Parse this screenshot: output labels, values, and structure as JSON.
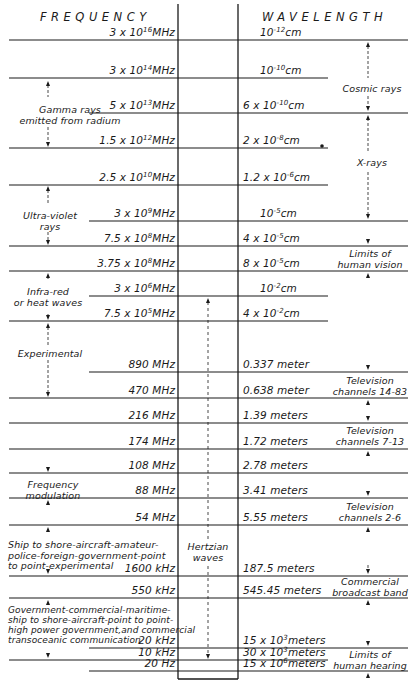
{
  "headers": {
    "frequency": "FREQUENCY",
    "wavelength": "WAVELENGTH"
  },
  "rows": [
    {
      "y": 40,
      "freq": "3 x 10",
      "freq_exp": "16",
      "freq_unit": "MHz",
      "wave": "10",
      "wave_exp": "-12",
      "wave_unit": "cm"
    },
    {
      "y": 78,
      "freq": "3 x 10",
      "freq_exp": "14",
      "freq_unit": "MHz",
      "wave": "10",
      "wave_exp": "-10",
      "wave_unit": "cm"
    },
    {
      "y": 113,
      "freq": "5 x 10",
      "freq_exp": "13",
      "freq_unit": "MHz",
      "wave": "6 x 10",
      "wave_exp": "-10",
      "wave_unit": "cm"
    },
    {
      "y": 148,
      "freq": "1.5 x 10",
      "freq_exp": "12",
      "freq_unit": "MHz",
      "wave": "2 x 10",
      "wave_exp": "-8",
      "wave_unit": "cm"
    },
    {
      "y": 185,
      "freq": "2.5 x 10",
      "freq_exp": "10",
      "freq_unit": "MHz",
      "wave": "1.2 x 10",
      "wave_exp": "-6",
      "wave_unit": "cm"
    },
    {
      "y": 221,
      "freq": "3 x 10",
      "freq_exp": "9",
      "freq_unit": "MHz",
      "wave": "10",
      "wave_exp": "-5",
      "wave_unit": "cm"
    },
    {
      "y": 246,
      "freq": "7.5 x 10",
      "freq_exp": "8",
      "freq_unit": "MHz",
      "wave": "4 x 10",
      "wave_exp": "-5",
      "wave_unit": "cm"
    },
    {
      "y": 271,
      "freq": "3.75 x 10",
      "freq_exp": "8",
      "freq_unit": "MHz",
      "wave": "8 x 10",
      "wave_exp": "-5",
      "wave_unit": "cm"
    },
    {
      "y": 296,
      "freq": "3 x 10",
      "freq_exp": "6",
      "freq_unit": "MHz",
      "wave": "10",
      "wave_exp": "-2",
      "wave_unit": "cm"
    },
    {
      "y": 321,
      "freq": "7.5 x 10",
      "freq_exp": "5",
      "freq_unit": "MHz",
      "wave": "4 x 10",
      "wave_exp": "-2",
      "wave_unit": "cm"
    },
    {
      "y": 372,
      "freq": "890 MHz",
      "freq_exp": "",
      "freq_unit": "",
      "wave": "0.337 meter",
      "wave_exp": "",
      "wave_unit": ""
    },
    {
      "y": 398,
      "freq": "470 MHz",
      "freq_exp": "",
      "freq_unit": "",
      "wave": "0.638 meter",
      "wave_exp": "",
      "wave_unit": ""
    },
    {
      "y": 423,
      "freq": "216 MHz",
      "freq_exp": "",
      "freq_unit": "",
      "wave": "1.39 meters",
      "wave_exp": "",
      "wave_unit": ""
    },
    {
      "y": 449,
      "freq": "174 MHz",
      "freq_exp": "",
      "freq_unit": "",
      "wave": "1.72 meters",
      "wave_exp": "",
      "wave_unit": ""
    },
    {
      "y": 473,
      "freq": "108 MHz",
      "freq_exp": "",
      "freq_unit": "",
      "wave": "2.78 meters",
      "wave_exp": "",
      "wave_unit": ""
    },
    {
      "y": 498,
      "freq": "88 MHz",
      "freq_exp": "",
      "freq_unit": "",
      "wave": "3.41 meters",
      "wave_exp": "",
      "wave_unit": ""
    },
    {
      "y": 525,
      "freq": "54 MHz",
      "freq_exp": "",
      "freq_unit": "",
      "wave": "5.55 meters",
      "wave_exp": "",
      "wave_unit": ""
    },
    {
      "y": 576,
      "freq": "1600 kHz",
      "freq_exp": "",
      "freq_unit": "",
      "wave": "187.5 meters",
      "wave_exp": "",
      "wave_unit": ""
    },
    {
      "y": 598,
      "freq": "550 kHz",
      "freq_exp": "",
      "freq_unit": "",
      "wave": "545.45 meters",
      "wave_exp": "",
      "wave_unit": ""
    },
    {
      "y": 648,
      "freq": "20 kHz",
      "freq_exp": "",
      "freq_unit": "",
      "wave": "15 x 10",
      "wave_exp": "3",
      "wave_unit": "meters"
    },
    {
      "y": 660,
      "freq": "10 kHz",
      "freq_exp": "",
      "freq_unit": "",
      "wave": "30 x 10",
      "wave_exp": "3",
      "wave_unit": "meters"
    },
    {
      "y": 671,
      "freq": "20 Hz",
      "freq_exp": "",
      "freq_unit": "",
      "wave": "15 x 10",
      "wave_exp": "6",
      "wave_unit": "meters"
    }
  ],
  "left_bands": [
    {
      "label": "Gamma rays\nemitted from radium"
    },
    {
      "label": "Ultra-violet\nrays"
    },
    {
      "label": "Infra-red\nor heat waves"
    },
    {
      "label": "Experimental"
    },
    {
      "label": "Frequency\nmodulation"
    },
    {
      "label": "Ship to shore-aircraft-amateur-\npolice-foreign-government-point\nto point-experimental"
    },
    {
      "label": "Government-commercial-maritime-\nship to shore-aircraft-point to point-\nhigh power government,and commercial\ntransoceanic communication"
    }
  ],
  "right_bands": [
    {
      "label": "Cosmic rays"
    },
    {
      "label": "X-rays"
    },
    {
      "label": "Limits of\nhuman vision"
    },
    {
      "label": "Television\nchannels 14-83"
    },
    {
      "label": "Television\nchannels 7-13"
    },
    {
      "label": "Television\nchannels 2-6"
    },
    {
      "label": "Commercial\nbroadcast band"
    },
    {
      "label": "Limits of\nhuman hearing"
    }
  ],
  "center_band": {
    "label": "Hertzian\nwaves"
  },
  "colors": {
    "ink": "#1a1a1a",
    "paper": "#ffffff"
  }
}
